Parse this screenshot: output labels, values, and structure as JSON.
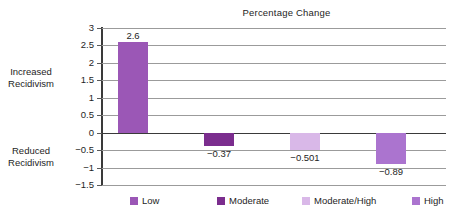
{
  "chart_data": {
    "type": "bar",
    "title": "Percentage Change",
    "xlabel": "",
    "ylabel": "",
    "categories": [
      "Low",
      "Moderate",
      "Moderate/High",
      "High"
    ],
    "values": [
      2.6,
      -0.37,
      -0.501,
      -0.89
    ],
    "value_labels": [
      "2.6",
      "−0.37",
      "−0.501",
      "−0.89"
    ],
    "ylim": [
      -1.5,
      3
    ],
    "ytick_labels": [
      "3",
      "2.5",
      "2",
      "1.5",
      "1",
      "0.5",
      "0",
      "−0.5",
      "−1",
      "−1.5"
    ],
    "ytick_values": [
      3,
      2.5,
      2,
      1.5,
      1,
      0.5,
      0,
      -0.5,
      -1,
      -1.5
    ],
    "grid": true,
    "legend_position": "bottom",
    "legend": [
      {
        "label": "Low",
        "color": "#9b57b6"
      },
      {
        "label": "Moderate",
        "color": "#7b2d8e"
      },
      {
        "label": "Moderate/High",
        "color": "#d9b8e8"
      },
      {
        "label": "High",
        "color": "#ab74cf"
      }
    ],
    "series_colors": [
      "#9b57b6",
      "#7b2d8e",
      "#d9b8e8",
      "#ab74cf"
    ],
    "annotations": [
      {
        "text": "Increased Recidivism",
        "position": "left-upper"
      },
      {
        "text": "Reduced Recidivism",
        "position": "left-lower"
      }
    ]
  },
  "side_labels": {
    "increased_line1": "Increased",
    "increased_line2": "Recidivism",
    "reduced_line1": "Reduced",
    "reduced_line2": "Recidivism"
  }
}
